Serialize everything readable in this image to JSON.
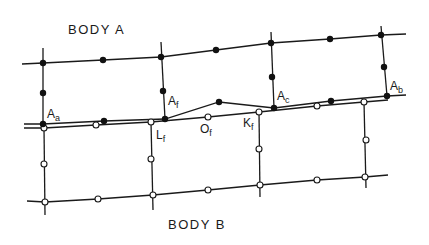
{
  "titles": {
    "body_a": "BODY A",
    "body_b": "BODY B"
  },
  "labels": {
    "Aa": {
      "main": "A",
      "sub": "a"
    },
    "Af": {
      "main": "A",
      "sub": "f"
    },
    "Ac": {
      "main": "A",
      "sub": "c"
    },
    "Ab": {
      "main": "A",
      "sub": "b"
    },
    "Lf": {
      "main": "L",
      "sub": "f"
    },
    "Of": {
      "main": "O",
      "sub": "f"
    },
    "Kf": {
      "main": "K",
      "sub": "f"
    }
  },
  "colors": {
    "line": "#1a1a1a",
    "filled_node": "#111111",
    "open_node_fill": "#ffffff",
    "background": "#ffffff"
  },
  "body_a": {
    "node_style": "filled",
    "top_line": [
      [
        22,
        64
      ],
      [
        43,
        63
      ],
      [
        103,
        60
      ],
      [
        161,
        57
      ],
      [
        216,
        50
      ],
      [
        271,
        43
      ],
      [
        330,
        39
      ],
      [
        381,
        35
      ],
      [
        406,
        34
      ]
    ],
    "top_nodes": [
      [
        43,
        63
      ],
      [
        103,
        60
      ],
      [
        161,
        57
      ],
      [
        216,
        50
      ],
      [
        271,
        43
      ],
      [
        330,
        39
      ],
      [
        381,
        35
      ]
    ],
    "verticals": [
      [
        [
          43,
          48
        ],
        [
          43,
          124
        ]
      ],
      [
        [
          161,
          42
        ],
        [
          165,
          119
        ]
      ],
      [
        [
          271,
          32
        ],
        [
          274,
          108
        ]
      ],
      [
        [
          381,
          26
        ],
        [
          387,
          96
        ]
      ]
    ],
    "mid_nodes": [
      [
        43,
        93
      ],
      [
        163,
        91
      ],
      [
        272,
        77
      ],
      [
        384,
        67
      ]
    ],
    "bottom_line": [
      [
        24,
        124
      ],
      [
        43,
        124
      ],
      [
        104,
        121
      ],
      [
        165,
        119
      ],
      [
        219,
        102
      ],
      [
        274,
        108
      ],
      [
        331,
        101
      ],
      [
        387,
        96
      ],
      [
        406,
        95
      ]
    ],
    "bottom_nodes": [
      [
        43,
        124
      ],
      [
        104,
        121
      ],
      [
        165,
        119
      ],
      [
        219,
        102
      ],
      [
        274,
        108
      ],
      [
        331,
        101
      ],
      [
        387,
        96
      ]
    ]
  },
  "body_b": {
    "node_style": "open",
    "top_line": [
      [
        24,
        128
      ],
      [
        44,
        128
      ],
      [
        96,
        125
      ],
      [
        151,
        122
      ],
      [
        208,
        117
      ],
      [
        259,
        112
      ],
      [
        317,
        106
      ],
      [
        364,
        102
      ],
      [
        388,
        100
      ]
    ],
    "top_nodes": [
      [
        44,
        128
      ],
      [
        96,
        125
      ],
      [
        151,
        122
      ],
      [
        208,
        117
      ],
      [
        259,
        112
      ],
      [
        317,
        106
      ],
      [
        364,
        102
      ]
    ],
    "verticals": [
      [
        [
          44,
          128
        ],
        [
          45,
          215
        ]
      ],
      [
        [
          151,
          122
        ],
        [
          153,
          210
        ]
      ],
      [
        [
          259,
          112
        ],
        [
          260,
          197
        ]
      ],
      [
        [
          364,
          102
        ],
        [
          366,
          188
        ]
      ]
    ],
    "mid_nodes": [
      [
        44,
        164
      ],
      [
        151,
        159
      ],
      [
        259,
        149
      ],
      [
        366,
        140
      ]
    ],
    "bottom_line": [
      [
        27,
        201
      ],
      [
        45,
        202
      ],
      [
        98,
        199
      ],
      [
        153,
        195
      ],
      [
        208,
        190
      ],
      [
        260,
        185
      ],
      [
        317,
        180
      ],
      [
        365,
        177
      ],
      [
        388,
        175
      ]
    ],
    "bottom_nodes": [
      [
        45,
        202
      ],
      [
        98,
        199
      ],
      [
        153,
        195
      ],
      [
        208,
        190
      ],
      [
        260,
        185
      ],
      [
        317,
        180
      ],
      [
        365,
        177
      ]
    ]
  }
}
